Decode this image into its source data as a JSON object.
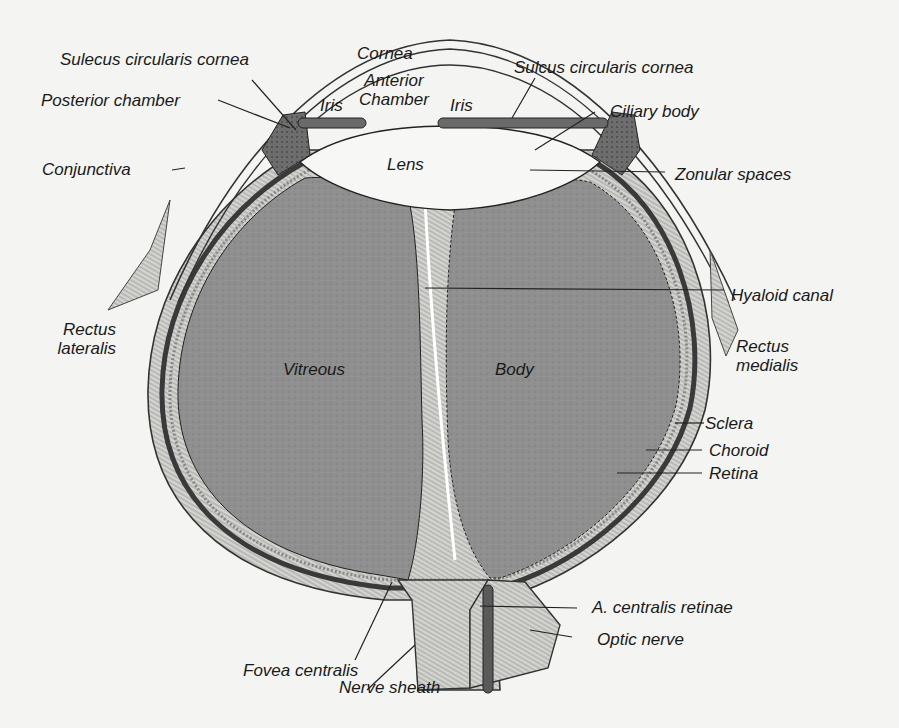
{
  "diagram": {
    "colors": {
      "background": "#f4f4f2",
      "vitreous_fill": "#8d8d8d",
      "ink": "#1a1a1a",
      "tissue_dark": "#555555",
      "tissue_light": "#d9d9d6"
    },
    "labels": {
      "sulecus_left": "Sulecus circularis cornea",
      "cornea": "Cornea",
      "anterior_chamber": "Anterior\nChamber",
      "iris_left": "Iris",
      "iris_right": "Iris",
      "sulcus_right": "Sulcus circularis cornea",
      "posterior_chamber": "Posterior chamber",
      "ciliary_body": "Ciliary body",
      "conjunctiva": "Conjunctiva",
      "lens": "Lens",
      "zonular_spaces": "Zonular spaces",
      "hyaloid_canal": "Hyaloid canal",
      "rectus_lateralis": "Rectus\nlateralis",
      "vitreous": "Vitreous",
      "body": "Body",
      "rectus_medialis": "Rectus\nmedialis",
      "sclera": "Sclera",
      "choroid": "Choroid",
      "retina": "Retina",
      "a_centralis_retinae": "A. centralis retinae",
      "optic_nerve": "Optic nerve",
      "fovea_centralis": "Fovea centralis",
      "nerve_sheath": "Nerve sheath"
    }
  }
}
